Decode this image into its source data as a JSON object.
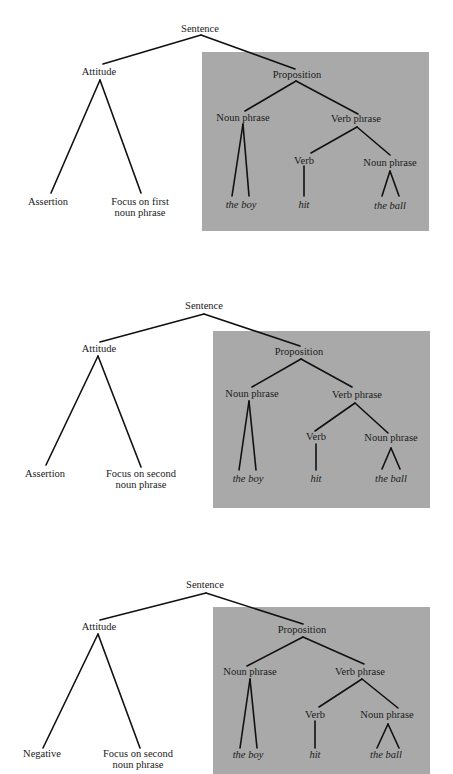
{
  "colors": {
    "box": "#a9a9a9",
    "line": "#111111",
    "text": "#1a1a1a",
    "background": "#ffffff"
  },
  "trees": [
    {
      "root": "Sentence",
      "attitude": {
        "label": "Attitude",
        "left": "Assertion",
        "right_line1": "Focus on first",
        "right_line2": "noun phrase"
      },
      "proposition": {
        "label": "Proposition",
        "noun_phrase": {
          "label": "Noun phrase",
          "leaf": "the boy"
        },
        "verb_phrase": {
          "label": "Verb phrase",
          "verb": {
            "label": "Verb",
            "leaf": "hit"
          },
          "noun_phrase": {
            "label": "Noun phrase",
            "leaf": "the ball"
          }
        }
      }
    },
    {
      "root": "Sentence",
      "attitude": {
        "label": "Attitude",
        "left": "Assertion",
        "right_line1": "Focus on second",
        "right_line2": "noun phrase"
      },
      "proposition": {
        "label": "Proposition",
        "noun_phrase": {
          "label": "Noun phrase",
          "leaf": "the boy"
        },
        "verb_phrase": {
          "label": "Verb phrase",
          "verb": {
            "label": "Verb",
            "leaf": "hit"
          },
          "noun_phrase": {
            "label": "Noun phrase",
            "leaf": "the ball"
          }
        }
      }
    },
    {
      "root": "Sentence",
      "attitude": {
        "label": "Attitude",
        "left": "Negative",
        "right_line1": "Focus on second",
        "right_line2": "noun phrase"
      },
      "proposition": {
        "label": "Proposition",
        "noun_phrase": {
          "label": "Noun phrase",
          "leaf": "the boy"
        },
        "verb_phrase": {
          "label": "Verb phrase",
          "verb": {
            "label": "Verb",
            "leaf": "hit"
          },
          "noun_phrase": {
            "label": "Noun phrase",
            "leaf": "the ball"
          }
        }
      }
    }
  ]
}
